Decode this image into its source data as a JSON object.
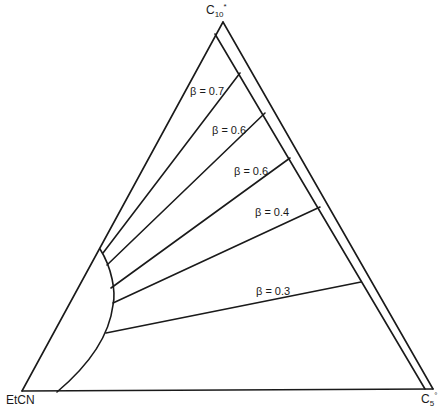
{
  "diagram": {
    "type": "ternary-phase-diagram",
    "vertices": {
      "top": {
        "label": "C",
        "sub": "10",
        "sup": "*"
      },
      "bottom_left": {
        "label": "EtCN"
      },
      "bottom_right": {
        "label": "C",
        "sub": "5",
        "sup": "°"
      }
    },
    "tie_lines": [
      {
        "label": "β = 0.7",
        "from": [
          103,
          252
        ],
        "to": [
          240,
          73
        ]
      },
      {
        "label": "β = 0.6",
        "from": [
          107,
          264
        ],
        "to": [
          265,
          113
        ]
      },
      {
        "label": "β = 0.6",
        "from": [
          111,
          287
        ],
        "to": [
          290,
          158
        ]
      },
      {
        "label": "β = 0.4",
        "from": [
          113,
          302
        ],
        "to": [
          320,
          207
        ]
      },
      {
        "label": "β = 0.3",
        "from": [
          106,
          333
        ],
        "to": [
          361,
          282
        ]
      }
    ],
    "colors": {
      "line": "#1a1a1a",
      "background": "#ffffff"
    }
  }
}
